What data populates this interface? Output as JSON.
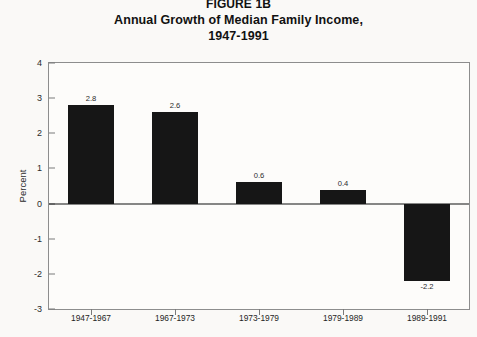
{
  "figure": {
    "title_lines": [
      "FIGURE 1B",
      "Annual Growth of Median Family Income,",
      "1947-1991"
    ],
    "bar_color": "#161616",
    "background_color": "#faf9f7",
    "frame_color": "#8d8d8d"
  },
  "chart_data": {
    "type": "bar",
    "title": "FIGURE 1B Annual Growth of Median Family Income, 1947-1991",
    "subtitle": "1947-1991",
    "categories": [
      "1947-1967",
      "1967-1973",
      "1973-1979",
      "1979-1989",
      "1989-1991"
    ],
    "values": [
      2.8,
      2.6,
      0.6,
      0.4,
      -2.2
    ],
    "data_labels": [
      "2.8",
      "2.6",
      "0.6",
      "0.4",
      "-2.2"
    ],
    "xlabel": "",
    "ylabel": "Percent",
    "ylim": [
      -3,
      4
    ],
    "ytick_values": [
      4,
      3,
      2,
      1,
      0,
      -1,
      -2,
      -3
    ],
    "ytick_labels": [
      "4",
      "3",
      "2",
      "1",
      "0",
      "-1",
      "-2",
      "-3"
    ],
    "grid": false,
    "legend": false,
    "zero_line": true
  }
}
